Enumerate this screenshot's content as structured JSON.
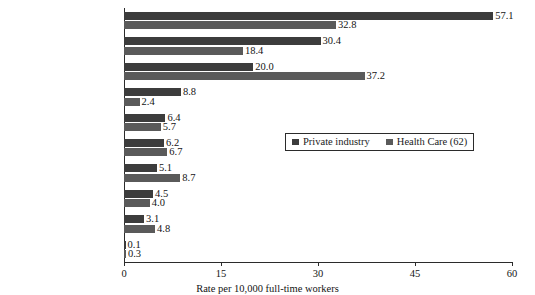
{
  "chart_data": {
    "type": "bar",
    "orientation": "horizontal",
    "title": "",
    "xlabel": "Rate per 10,000 full-time workers",
    "ylabel": "",
    "xlim": [
      0,
      60
    ],
    "xticks": [
      "0",
      "15",
      "30",
      "45",
      "60"
    ],
    "grid": false,
    "legend_position": "center-right",
    "categories": [
      "Overexertion",
      "Fall on same level",
      "Contact with\nobject and equipment",
      "Assault and violent act",
      "Exposed to harmful\nsubstance",
      "Transportation accidents",
      "Fall to lower level",
      "Slips and trips",
      "Repetitive motion",
      "Fires and explosions"
    ],
    "series": [
      {
        "name": "Private industry",
        "color": "#3c3c3c",
        "values": [
          57.1,
          30.4,
          20.0,
          8.8,
          6.4,
          6.2,
          5.1,
          4.5,
          3.1,
          0.1
        ],
        "labels": [
          "57.1",
          "30.4",
          "20.0",
          "8.8",
          "6.4",
          "6.2",
          "5.1",
          "4.5",
          "3.1",
          "0.1"
        ]
      },
      {
        "name": "Health Care (62)",
        "color": "#5a5a5a",
        "values": [
          32.8,
          18.4,
          37.2,
          2.4,
          5.7,
          6.7,
          8.7,
          4.0,
          4.8,
          0.3
        ],
        "labels": [
          "32.8",
          "18.4",
          "37.2",
          "2.4",
          "5.7",
          "6.7",
          "8.7",
          "4.0",
          "4.8",
          "0.3"
        ]
      }
    ]
  },
  "legend": {
    "entries": [
      {
        "label": "Private industry"
      },
      {
        "label": "Health Care (62)"
      }
    ]
  }
}
